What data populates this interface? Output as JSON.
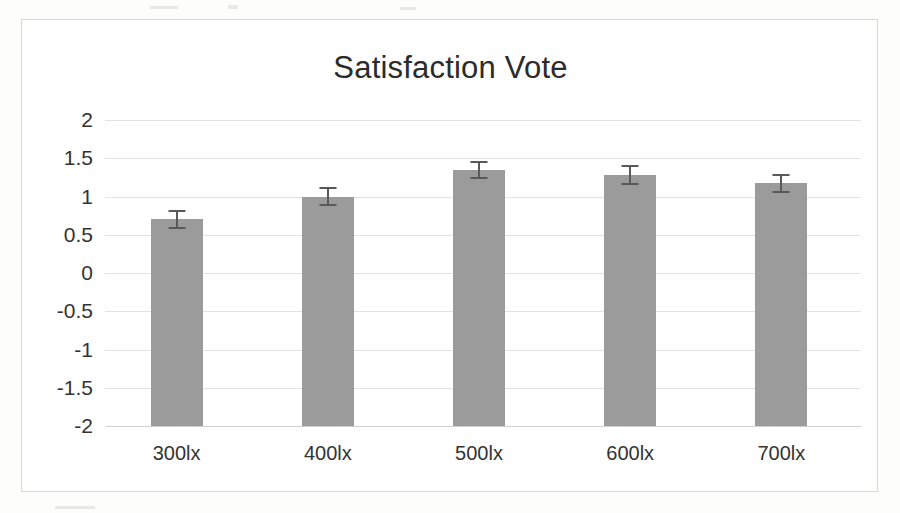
{
  "figure": {
    "frame_border_color": "#d9d9d9",
    "background_color": "#ffffff"
  },
  "chart_data": {
    "type": "bar",
    "title": "Satisfaction Vote",
    "xlabel": "",
    "ylabel": "",
    "categories": [
      "300lx",
      "400lx",
      "500lx",
      "600lx",
      "700lx"
    ],
    "values": [
      0.7,
      1.0,
      1.35,
      1.28,
      1.17
    ],
    "errors": [
      0.13,
      0.12,
      0.12,
      0.13,
      0.13
    ],
    "ylim": [
      -2,
      2
    ],
    "ytick_labels": [
      "2",
      "1.5",
      "1",
      "0.5",
      "0",
      "-0.5",
      "-1",
      "-1.5",
      "-2"
    ],
    "ytick_values": [
      2,
      1.5,
      1,
      0.5,
      0,
      -0.5,
      -1,
      -1.5,
      -2
    ],
    "grid": true,
    "legend": false,
    "bar_color": "#9b9b9b",
    "error_bar_color": "#595959",
    "gridline_color": "#e2e2e2"
  }
}
